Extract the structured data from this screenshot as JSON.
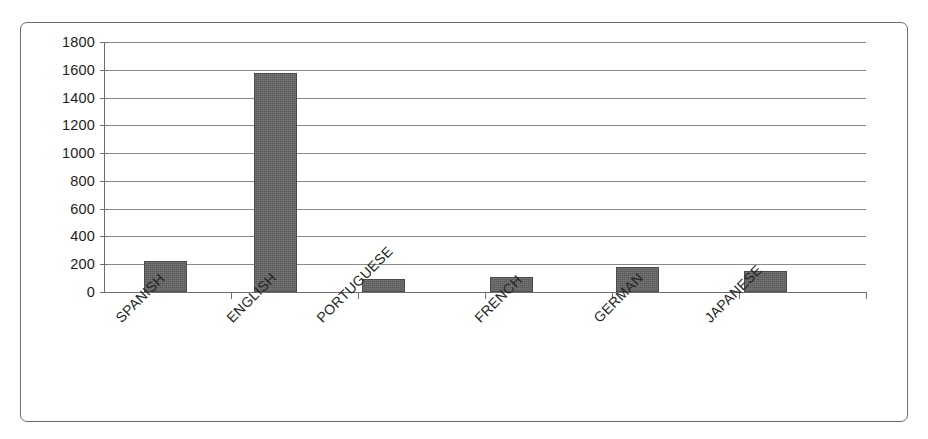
{
  "chart_data": {
    "type": "bar",
    "title": "",
    "subtitle": "",
    "xlabel": "",
    "ylabel": "",
    "categories": [
      "SPANISH",
      "ENGLISH",
      "PORTUGUESE",
      "FRENCH",
      "GERMAN",
      "JAPANESE"
    ],
    "values": [
      220,
      1580,
      95,
      105,
      180,
      150
    ],
    "ylim": [
      0,
      1800
    ],
    "ytick_step": 200,
    "ytick_labels": [
      "1800",
      "1600",
      "1400",
      "1200",
      "1000",
      "800",
      "600",
      "400",
      "200",
      "0"
    ],
    "ytick_values": [
      1800,
      1600,
      1400,
      1200,
      1000,
      800,
      600,
      400,
      200,
      0
    ],
    "grid": true,
    "legend": false,
    "legend_position": "none",
    "series": [
      {
        "name": "",
        "values": [
          220,
          1580,
          95,
          105,
          180,
          150
        ]
      }
    ],
    "bar_color": "#5b5b5b",
    "gridline_color": "#8a8a8a",
    "axis_color": "#6e6e6e",
    "background_color": "#ffffff",
    "border_color": "#6b6b6b",
    "label_rotation": -45
  }
}
